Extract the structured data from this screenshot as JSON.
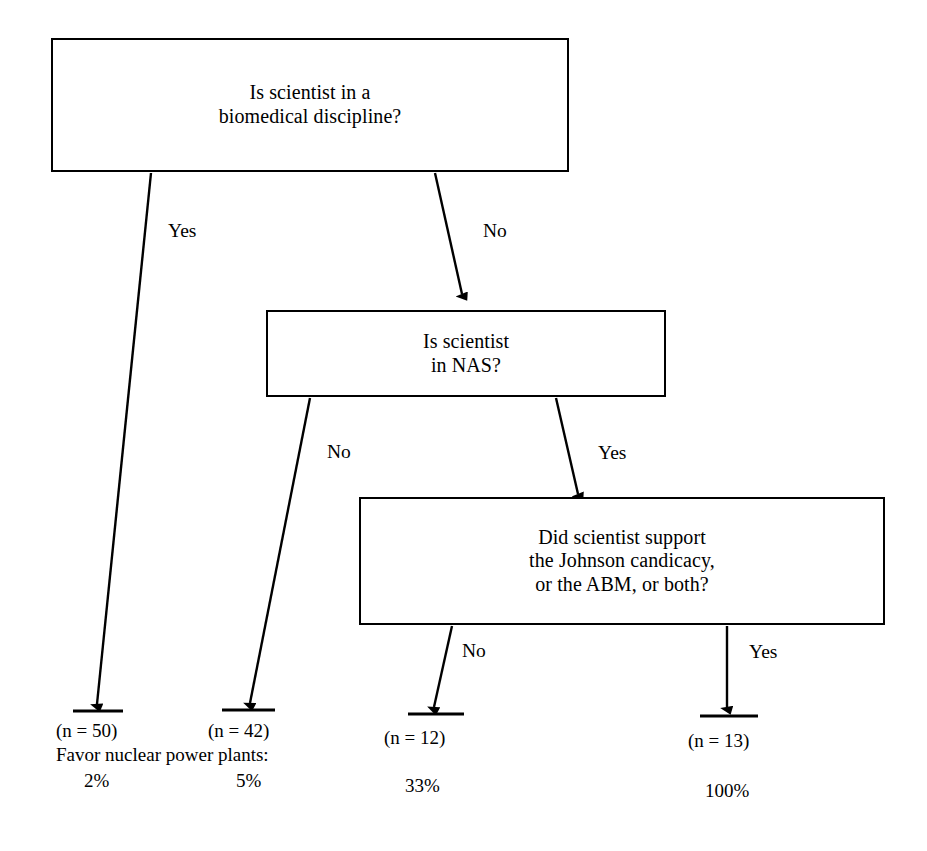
{
  "diagram": {
    "type": "decision-tree",
    "title_caption": "Favor nuclear power plants:",
    "nodes": [
      {
        "id": "root",
        "text": "Is scientist in a\nbiomedical discipline?",
        "x": 51,
        "y": 38,
        "w": 518,
        "h": 134
      },
      {
        "id": "nas",
        "text": "Is scientist\nin NAS?",
        "x": 266,
        "y": 310,
        "w": 400,
        "h": 87
      },
      {
        "id": "support",
        "text": "Did scientist support\nthe Johnson candicacy,\nor the ABM, or both?",
        "x": 359,
        "y": 497,
        "w": 526,
        "h": 128
      }
    ],
    "edges": [
      {
        "id": "root-yes",
        "label": "Yes",
        "from": "root",
        "x1": 151,
        "y1": 173,
        "x2": 97,
        "y2": 704,
        "label_x": 168,
        "label_y": 221
      },
      {
        "id": "root-no",
        "label": "No",
        "from": "root",
        "x1": 435,
        "y1": 173,
        "x2": 462,
        "y2": 294,
        "label_x": 483,
        "label_y": 221
      },
      {
        "id": "nas-no",
        "label": "No",
        "from": "nas",
        "x1": 310,
        "y1": 398,
        "x2": 250,
        "y2": 703,
        "label_x": 327,
        "label_y": 442
      },
      {
        "id": "nas-yes",
        "label": "Yes",
        "from": "nas",
        "x1": 556,
        "y1": 398,
        "x2": 578,
        "y2": 494,
        "label_x": 598,
        "label_y": 443
      },
      {
        "id": "sup-no",
        "label": "No",
        "from": "support",
        "x1": 452,
        "y1": 626,
        "x2": 434,
        "y2": 707,
        "label_x": 462,
        "label_y": 641
      },
      {
        "id": "sup-yes",
        "label": "Yes",
        "from": "support",
        "x1": 727,
        "y1": 626,
        "x2": 727,
        "y2": 707,
        "label_x": 749,
        "label_y": 642
      }
    ],
    "leaves": [
      {
        "id": "leaf-1",
        "n_label": "(n = 50)",
        "percent": "2%",
        "rule_x1": 73,
        "rule_x2": 123,
        "rule_y": 711,
        "n_x": 56,
        "n_y": 721,
        "pct_x": 84,
        "pct_y": 771
      },
      {
        "id": "leaf-2",
        "n_label": "(n = 42)",
        "percent": "5%",
        "rule_x1": 222,
        "rule_x2": 275,
        "rule_y": 710,
        "n_x": 208,
        "n_y": 721,
        "pct_x": 236,
        "pct_y": 771
      },
      {
        "id": "leaf-3",
        "n_label": "(n = 12)",
        "percent": "33%",
        "rule_x1": 408,
        "rule_x2": 464,
        "rule_y": 714,
        "n_x": 384,
        "n_y": 728,
        "pct_x": 405,
        "pct_y": 776
      },
      {
        "id": "leaf-4",
        "n_label": "(n = 13)",
        "percent": "100%",
        "rule_x1": 700,
        "rule_x2": 758,
        "rule_y": 716,
        "n_x": 688,
        "n_y": 731,
        "pct_x": 705,
        "pct_y": 781
      }
    ],
    "caption": {
      "text": "Favor nuclear power plants:",
      "x": 56,
      "y": 745
    },
    "colors": {
      "stroke": "#000000",
      "background": "#ffffff",
      "text": "#000000"
    }
  }
}
